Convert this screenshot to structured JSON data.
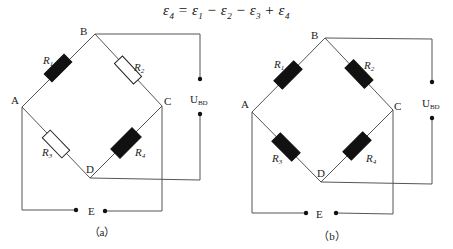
{
  "formula": {
    "text": "ε4 = ε1 − ε2 − ε3 + ε4",
    "lhs": "ε",
    "lhs_sub": "4",
    "terms": [
      {
        "sign": "=",
        "symbol": "ε",
        "sub": "1"
      },
      {
        "sign": "−",
        "symbol": "ε",
        "sub": "2"
      },
      {
        "sign": "−",
        "symbol": "ε",
        "sub": "3"
      },
      {
        "sign": "+",
        "symbol": "ε",
        "sub": "4"
      }
    ]
  },
  "diagrams": [
    {
      "caption": "（a）",
      "nodes": {
        "A": "A",
        "B": "B",
        "C": "C",
        "D": "D",
        "E": "E"
      },
      "output_label": "U",
      "output_sub": "BD",
      "resistors": [
        {
          "name": "R",
          "sub": "1",
          "filled": true
        },
        {
          "name": "R",
          "sub": "2",
          "filled": false
        },
        {
          "name": "R",
          "sub": "3",
          "filled": false
        },
        {
          "name": "R",
          "sub": "4",
          "filled": true
        }
      ]
    },
    {
      "caption": "（b）",
      "nodes": {
        "A": "A",
        "B": "B",
        "C": "C",
        "D": "D",
        "E": "E"
      },
      "output_label": "U",
      "output_sub": "BD",
      "resistors": [
        {
          "name": "R",
          "sub": "1",
          "filled": true
        },
        {
          "name": "R",
          "sub": "2",
          "filled": true
        },
        {
          "name": "R",
          "sub": "3",
          "filled": true
        },
        {
          "name": "R",
          "sub": "4",
          "filled": true
        }
      ]
    }
  ],
  "colors": {
    "wire": "#555555",
    "resistor_fill": "#111111",
    "text": "#222222"
  }
}
